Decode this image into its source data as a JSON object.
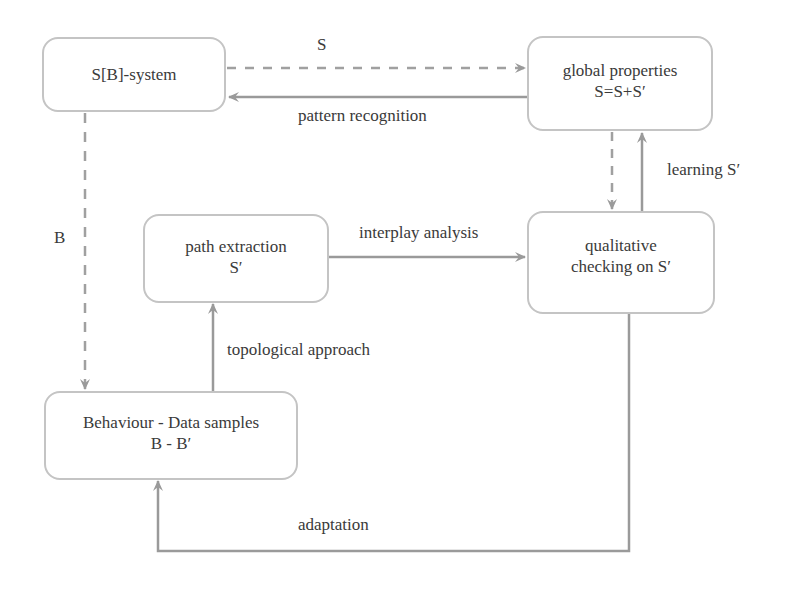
{
  "nodes": {
    "sb_system": {
      "line1": "S[B]-system",
      "line2": ""
    },
    "global_properties": {
      "line1": "global properties",
      "line2": "S=S+S′"
    },
    "path_extraction": {
      "line1": "path extraction",
      "line2": "S′"
    },
    "qualitative_checking": {
      "line1": "qualitative",
      "line2": "checking on S′"
    },
    "behaviour": {
      "line1": "Behaviour - Data samples",
      "line2": "B - B′"
    }
  },
  "edges": {
    "s_label": "S",
    "pattern_recognition": "pattern recognition",
    "b_label": "B",
    "learning": "learning S′",
    "interplay_analysis": "interplay analysis",
    "topological_approach": "topological  approach",
    "adaptation": "adaptation"
  },
  "colors": {
    "line": "#9a9a9a",
    "box_border": "#c4c4c4",
    "text": "#3a3a3a"
  }
}
